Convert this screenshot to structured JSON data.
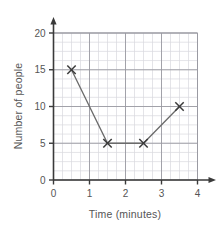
{
  "chart_data": {
    "type": "line",
    "title": "",
    "xlabel": "Time (minutes)",
    "ylabel": "Number of people",
    "x": [
      0.5,
      1.5,
      2.5,
      3.5
    ],
    "values": [
      15,
      5,
      5,
      10
    ],
    "series": [
      {
        "name": "Number of people",
        "points": [
          {
            "x": 0.5,
            "y": 15
          },
          {
            "x": 1.5,
            "y": 5
          },
          {
            "x": 2.5,
            "y": 5
          },
          {
            "x": 3.5,
            "y": 10
          }
        ]
      }
    ],
    "xlim": [
      0,
      4
    ],
    "ylim": [
      0,
      20
    ],
    "x_ticks": [
      0,
      1,
      2,
      3,
      4
    ],
    "y_ticks": [
      0,
      5,
      10,
      15,
      20
    ],
    "x_tick_labels": [
      "0",
      "1",
      "2",
      "3",
      "4"
    ],
    "y_tick_labels": [
      "0",
      "5",
      "10",
      "15",
      "20"
    ],
    "x_minor_step": 0.25,
    "y_minor_step": 1.25,
    "grid": true,
    "legend": false,
    "marker": "x",
    "line_color": "#6b6b6b",
    "marker_color": "#3a3a3a",
    "major_grid_color": "#9a9aa2",
    "minor_grid_color": "#d8d8de",
    "axis_color": "#3a3a3a"
  },
  "axes": {
    "x_label_text": "Time (minutes)",
    "y_label_text": "Number of people"
  }
}
